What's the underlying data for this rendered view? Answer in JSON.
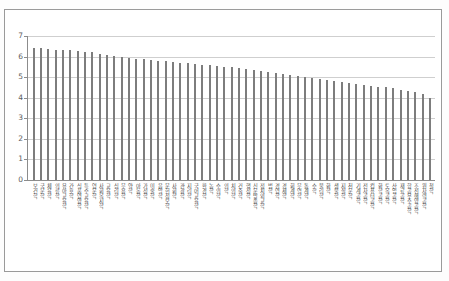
{
  "document": {
    "title_fragment": "",
    "note": ""
  },
  "chart_data": {
    "type": "bar",
    "title": "",
    "xlabel": "",
    "ylabel": "",
    "ylim": [
      0,
      7
    ],
    "yticks": [
      0,
      1,
      2,
      3,
      4,
      5,
      6,
      7
    ],
    "grid": true,
    "legend": "none",
    "bar_color": "#7d7d7d",
    "grid_color": "#cfcfcf",
    "axis_color": "#8c8c8c",
    "categories": [
      "보건학",
      "국문학",
      "체육학",
      "의류학",
      "유아교육학",
      "간호학",
      "식품영양학",
      "특수교육학",
      "영문학",
      "사회복지학",
      "교육학",
      "심리학",
      "무용학",
      "약학",
      "아동학",
      "가정학",
      "미술학",
      "음악학",
      "문헌정보학",
      "사회학",
      "관광학",
      "지리학",
      "국어교육학",
      "환경학",
      "농학",
      "수의학",
      "의학",
      "치의학",
      "건축학",
      "행정학",
      "신문방송학",
      "정치외교학",
      "법학",
      "경영학",
      "경제학",
      "회계학",
      "무역학",
      "통계학",
      "수학",
      "물리학",
      "화학",
      "생물학",
      "지질학",
      "천문학",
      "기계공학",
      "전자공학",
      "컴퓨터공학",
      "화학공학",
      "토목공학",
      "산업공학",
      "재료공학",
      "항공우주공학",
      "조선해양공학",
      "원자력공학",
      "철학"
    ],
    "values": [
      6.4,
      6.4,
      6.35,
      6.3,
      6.3,
      6.3,
      6.25,
      6.2,
      6.2,
      6.15,
      6.1,
      6.05,
      6.0,
      5.95,
      5.9,
      5.9,
      5.85,
      5.8,
      5.8,
      5.75,
      5.7,
      5.7,
      5.65,
      5.6,
      5.6,
      5.55,
      5.5,
      5.5,
      5.45,
      5.4,
      5.35,
      5.3,
      5.25,
      5.2,
      5.15,
      5.1,
      5.05,
      5.0,
      4.95,
      4.9,
      4.85,
      4.8,
      4.75,
      4.7,
      4.65,
      4.6,
      4.55,
      4.5,
      4.5,
      4.45,
      4.4,
      4.35,
      4.3,
      4.2,
      4.0
    ]
  }
}
